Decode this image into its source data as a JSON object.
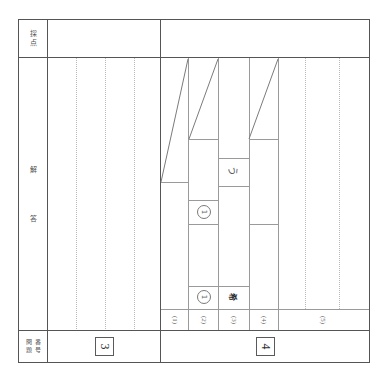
{
  "sheet": {
    "kind": "japanese-exam-answer-sheet",
    "ink_color": "#5b5b5b",
    "rule_color": "#6a6a6a",
    "guide_color": "#b9b9b9"
  },
  "header": {
    "scoring_label": "採点",
    "scoring_label_chars": [
      "採",
      "点"
    ]
  },
  "left_margin": {
    "answer_label_chars": [
      "解",
      "答"
    ],
    "answer_label": "解答"
  },
  "footer": {
    "question_label_col1": [
      "問",
      "題"
    ],
    "question_label_col2": [
      "番",
      "号"
    ],
    "question_label": "問題番号"
  },
  "blocks": [
    {
      "id": "block-3",
      "number": "3",
      "scoring_box_value": "",
      "guide_lines": 3
    },
    {
      "id": "block-4",
      "number": "4",
      "scoring_box_value": "",
      "guide_lines": 2
    }
  ],
  "sub_items": [
    {
      "label": "(1)",
      "id": "sub-1"
    },
    {
      "label": "(2)",
      "id": "sub-2"
    },
    {
      "label": "(3)",
      "id": "sub-3"
    },
    {
      "label": "(4)",
      "id": "sub-4"
    },
    {
      "label": "(5)",
      "id": "sub-5"
    }
  ],
  "answers": [
    {
      "id": "answer-a",
      "text": "う",
      "style": "plain"
    },
    {
      "id": "answer-b",
      "text": "1",
      "style": "circled"
    },
    {
      "id": "answer-c",
      "text": "1",
      "style": "circled"
    },
    {
      "id": "answer-d",
      "text": "希",
      "style": "dark"
    }
  ],
  "cancel_strokes": [
    {
      "id": "stroke-1"
    },
    {
      "id": "stroke-2"
    },
    {
      "id": "stroke-3"
    }
  ]
}
